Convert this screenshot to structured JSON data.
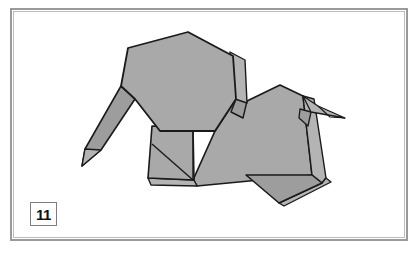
{
  "figure": {
    "kind": "origami-diagram",
    "step_number": "11",
    "caption": "",
    "colors": {
      "paper_fill": "#a9a9a9",
      "paper_fill_shaded": "#9d9d9d",
      "paper_fill_light": "#b4b4b4",
      "outline": "#1a1a1a",
      "frame_outer": "#9a9a9c",
      "frame_inner": "#bdbdbf",
      "background": "#ffffff",
      "badge_border": "#7d7d7f",
      "badge_text": "#111113"
    },
    "frame": {
      "x": 10,
      "y": 8,
      "width": 398,
      "height": 233
    },
    "badge": {
      "x": 30,
      "y": 202,
      "width": 27,
      "height": 24
    },
    "parts": [
      {
        "name": "trunk",
        "points": "121,86 135,99 101,150 82,166 85,149"
      },
      {
        "name": "trunk-underfold",
        "points": "82,166 85,149 101,150"
      },
      {
        "name": "head",
        "points": "121,86 128,48 188,32 233,56 236,99 215,131 160,131 135,99"
      },
      {
        "name": "ear-flap",
        "points": "233,56 245,60 247,101 236,99"
      },
      {
        "name": "neck-sliver",
        "points": "236,99 247,101 243,116 234,112"
      },
      {
        "name": "foreleg",
        "points": "152,126 193,128 194,180 148,178"
      },
      {
        "name": "foreleg-fold-a",
        "points": "152,144 193,180"
      },
      {
        "name": "foreleg-fold-b",
        "points": "193,128 193,180"
      },
      {
        "name": "foreleg-underlayer",
        "points": "148,178 194,180 197,186 151,185"
      },
      {
        "name": "body",
        "points": "215,131 236,99 247,101 280,85 303,96 312,175 197,186 193,180"
      },
      {
        "name": "body-lower-edge",
        "points": "197,186 312,175"
      },
      {
        "name": "hindleg",
        "points": "246,175 312,175 322,183 279,203"
      },
      {
        "name": "hindleg-underlayer",
        "points": "279,203 322,183 326,178 331,182 284,206"
      },
      {
        "name": "rump-sliver",
        "points": "303,96 312,175 322,183 326,178 314,99"
      },
      {
        "name": "tail-upper",
        "points": "303,96 318,106 345,118 311,112"
      },
      {
        "name": "tail-lower",
        "points": "303,96 311,112 308,126 300,109"
      },
      {
        "name": "tail-tip",
        "points": "318,106 345,118 330,117"
      }
    ]
  }
}
